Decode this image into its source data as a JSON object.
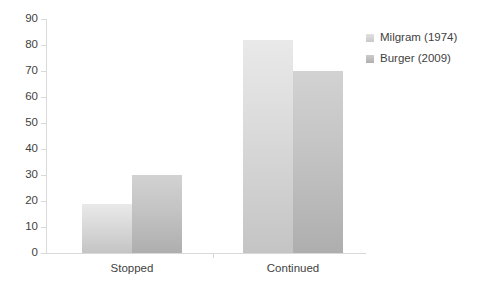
{
  "chart_data": {
    "type": "bar",
    "title": "",
    "subtitle": "",
    "xlabel": "",
    "ylabel": "",
    "categories": [
      "Stopped",
      "Continued"
    ],
    "series": [
      {
        "name": "Milgram (1974)",
        "values": [
          19,
          82
        ],
        "color": "#d5d5d5"
      },
      {
        "name": "Burger (2009)",
        "values": [
          30,
          70
        ],
        "color": "#bdbdbd"
      }
    ],
    "ylim": [
      0,
      90
    ],
    "ytick_step": 10,
    "yticks": [
      0,
      10,
      20,
      30,
      40,
      50,
      60,
      70,
      80,
      90
    ],
    "ytick_labels": [
      "0",
      "10",
      "20",
      "30",
      "40",
      "50",
      "60",
      "70",
      "80",
      "90"
    ],
    "grid": false,
    "legend_position": "right",
    "bar_gap_within_group": 0,
    "axis_color": "#d9d9d9",
    "text_color": "#3f3f3f",
    "background": "#ffffff"
  }
}
